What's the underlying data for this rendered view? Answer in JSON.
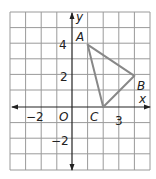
{
  "figure": {
    "type": "coordinate-plane",
    "grid": {
      "xmin": -4,
      "xmax": 5,
      "ymin": -4,
      "ymax": 6,
      "step": 1
    },
    "axes": {
      "x_label": "x",
      "y_label": "y",
      "origin_label": "O"
    },
    "tick_labels": {
      "x": [
        "−2",
        "3"
      ],
      "y": [
        "4",
        "2",
        "−2"
      ]
    },
    "triangle": {
      "color": "#888888",
      "vertices": [
        {
          "label": "A",
          "x": 1,
          "y": 4
        },
        {
          "label": "B",
          "x": 4,
          "y": 2
        },
        {
          "label": "C",
          "x": 2,
          "y": 0
        }
      ]
    }
  }
}
